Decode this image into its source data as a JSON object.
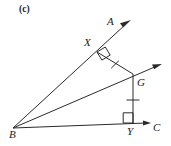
{
  "figure": {
    "part_label": "(c)",
    "stroke_color": "#2b2b2b",
    "label_color": "#1a1a1a",
    "background_color": "#ffffff",
    "labels": {
      "A": "A",
      "B": "B",
      "C": "C",
      "G": "G",
      "X": "X",
      "Y": "Y"
    },
    "points": {
      "B": {
        "x": 13,
        "y": 128
      },
      "A_arrow_tip": {
        "x": 131,
        "y": 20
      },
      "C_arrow_tip": {
        "x": 151,
        "y": 123
      },
      "G": {
        "x": 133,
        "y": 74
      },
      "X": {
        "x": 97,
        "y": 52
      },
      "Y": {
        "x": 133,
        "y": 123
      },
      "G_ray_arrow_tip": {
        "x": 162,
        "y": 64
      }
    },
    "segments": [
      {
        "name": "ray-BA",
        "from": "B",
        "to": "A_arrow_tip",
        "arrow": true
      },
      {
        "name": "ray-BC",
        "from": "B",
        "to": "C_arrow_tip",
        "arrow": true
      },
      {
        "name": "ray-BG",
        "from": "B",
        "to": "G_ray_arrow_tip",
        "arrow": true
      },
      {
        "name": "segment-GX",
        "from": "G",
        "to": "X",
        "arrow": false
      },
      {
        "name": "segment-GY",
        "from": "G",
        "to": "Y",
        "arrow": false
      }
    ],
    "right_angles": [
      {
        "name": "right-angle-at-X",
        "vertex": "X"
      },
      {
        "name": "right-angle-at-Y",
        "vertex": "Y"
      }
    ],
    "tick_marks": [
      {
        "name": "tick-on-GX",
        "segment": "segment-GX",
        "count": 1
      },
      {
        "name": "tick-on-GY",
        "segment": "segment-GY",
        "count": 1
      }
    ]
  }
}
